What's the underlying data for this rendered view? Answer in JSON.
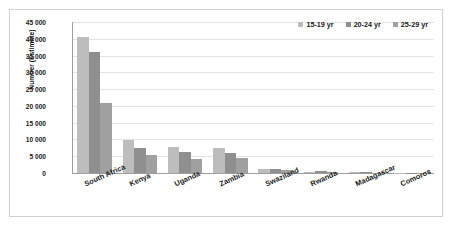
{
  "chart_data": {
    "type": "bar",
    "title": "",
    "subtitle": "",
    "xlabel": "",
    "ylabel": "Number (Estimate)",
    "ylim": [
      0,
      45000
    ],
    "ytick_values": [
      0,
      5000,
      10000,
      15000,
      20000,
      25000,
      30000,
      35000,
      40000,
      45000
    ],
    "ytick_labels": [
      "0",
      "5 000",
      "10 000",
      "15 000",
      "20 000",
      "25 000",
      "30 000",
      "35 000",
      "40 000",
      "45 000"
    ],
    "grid": true,
    "grid_axis": "y",
    "legend_position": "top-right",
    "categories": [
      "South Africa",
      "Kenya",
      "Uganda",
      "Zambia",
      "Swaziland",
      "Rwanda",
      "Madagascar",
      "Comoros"
    ],
    "series": [
      {
        "name": "15-19 yr",
        "color": "#bdbdbd",
        "values": [
          40500,
          9800,
          7900,
          7600,
          1100,
          350,
          180,
          40
        ]
      },
      {
        "name": "20-24 yr",
        "color": "#8f8f8f",
        "values": [
          36200,
          7400,
          6300,
          6000,
          1150,
          550,
          200,
          50
        ]
      },
      {
        "name": "25-29 yr",
        "color": "#a0a0a0",
        "values": [
          21000,
          5500,
          4200,
          4400,
          800,
          450,
          150,
          30
        ]
      }
    ]
  },
  "legend": {
    "items": [
      {
        "label": "15-19 yr",
        "color": "#bdbdbd"
      },
      {
        "label": "20-24 yr",
        "color": "#8f8f8f"
      },
      {
        "label": "25-29 yr",
        "color": "#a0a0a0"
      }
    ]
  },
  "axes": {
    "y_title": "Number (Estimate)"
  }
}
